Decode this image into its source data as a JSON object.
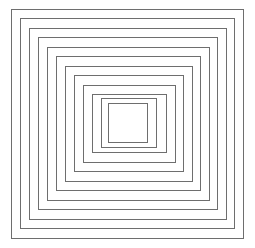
{
  "figure": {
    "type": "line-art-diagram",
    "background_color": "#ffffff",
    "stroke_color": "#6e6e6e",
    "stroke_width": 1,
    "fill": "none",
    "canvas": {
      "width": 255,
      "height": 248
    },
    "rectangle_count": 12,
    "center": {
      "x": 127.5,
      "y": 122.5
    },
    "rectangles": [
      {
        "index": 1,
        "label": "outer-ring-1",
        "x": 11.0,
        "y": 9.0,
        "width": 232.0,
        "height": 229.0
      },
      {
        "index": 2,
        "label": "ring-2",
        "x": 20.0,
        "y": 18.5,
        "width": 214.5,
        "height": 210.0
      },
      {
        "index": 3,
        "label": "ring-3",
        "x": 29.0,
        "y": 28.0,
        "width": 197.0,
        "height": 191.0
      },
      {
        "index": 4,
        "label": "ring-4",
        "x": 38.0,
        "y": 37.5,
        "width": 179.5,
        "height": 172.0
      },
      {
        "index": 5,
        "label": "ring-5",
        "x": 47.0,
        "y": 47.0,
        "width": 162.0,
        "height": 153.0
      },
      {
        "index": 6,
        "label": "ring-6",
        "x": 56.0,
        "y": 56.5,
        "width": 144.5,
        "height": 134.0
      },
      {
        "index": 7,
        "label": "ring-7",
        "x": 65.0,
        "y": 66.0,
        "width": 127.0,
        "height": 115.0
      },
      {
        "index": 8,
        "label": "ring-8",
        "x": 74.0,
        "y": 75.5,
        "width": 109.5,
        "height": 96.0
      },
      {
        "index": 9,
        "label": "ring-9",
        "x": 83.0,
        "y": 85.0,
        "width": 92.0,
        "height": 77.0
      },
      {
        "index": 10,
        "label": "ring-10",
        "x": 92.0,
        "y": 94.0,
        "width": 74.5,
        "height": 58.5
      },
      {
        "index": 11,
        "label": "ring-11",
        "x": 101.0,
        "y": 98.5,
        "width": 55.0,
        "height": 48.5
      },
      {
        "index": 12,
        "label": "inner-square",
        "x": 108.0,
        "y": 103.0,
        "width": 39.0,
        "height": 39.0
      }
    ]
  }
}
